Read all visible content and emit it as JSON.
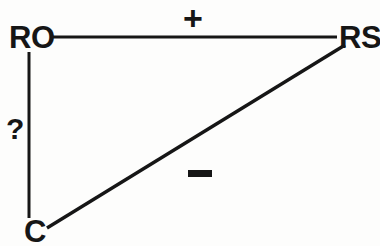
{
  "diagram": {
    "background_color": "#fdfdfc",
    "ink_color": "#161616",
    "nodes": [
      {
        "id": "RO",
        "label": "RO",
        "x": 29,
        "y": 37,
        "position": "top-left"
      },
      {
        "id": "RS",
        "label": "RS",
        "x": 352,
        "y": 37,
        "position": "top-right"
      },
      {
        "id": "C",
        "label": "C",
        "x": 33,
        "y": 229,
        "position": "bottom-left"
      }
    ],
    "edges": [
      {
        "id": "ro-rs",
        "from": "RO",
        "to": "RS",
        "sign": "+",
        "sign_name": "plus-sign",
        "orientation": "horizontal",
        "x1": 50,
        "y1": 37,
        "x2": 337,
        "y2": 37
      },
      {
        "id": "c-rs",
        "from": "C",
        "to": "RS",
        "sign": "−",
        "sign_name": "minus-sign",
        "orientation": "diagonal",
        "x1": 47,
        "y1": 228,
        "x2": 345,
        "y2": 45
      },
      {
        "id": "ro-c",
        "from": "RO",
        "to": "C",
        "sign": "?",
        "sign_name": "question-mark",
        "orientation": "vertical",
        "x1": 29,
        "y1": 52,
        "x2": 29,
        "y2": 218
      }
    ]
  }
}
